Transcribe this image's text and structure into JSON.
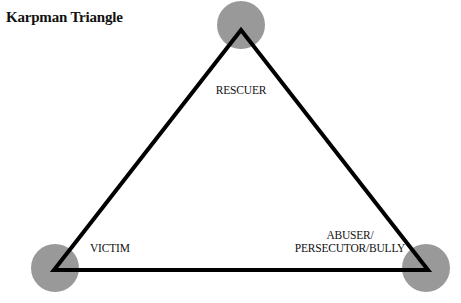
{
  "title": "Karpman Triangle",
  "diagram": {
    "type": "triangle",
    "colors": {
      "node_fill": "#999999",
      "edge": "#000000"
    },
    "nodes": [
      {
        "id": "rescuer",
        "label": "RESCUER",
        "position": "top"
      },
      {
        "id": "victim",
        "label": "VICTIM",
        "position": "bottom-left"
      },
      {
        "id": "persecutor",
        "label_line1": "ABUSER/",
        "label_line2": "PERSECUTOR/BULLY",
        "position": "bottom-right"
      }
    ],
    "edges": [
      {
        "from": "rescuer",
        "to": "victim"
      },
      {
        "from": "victim",
        "to": "persecutor"
      },
      {
        "from": "persecutor",
        "to": "rescuer"
      }
    ]
  }
}
